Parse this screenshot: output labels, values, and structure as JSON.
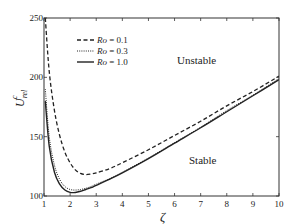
{
  "chart_data": {
    "type": "line",
    "title": "",
    "xlabel": "ζ",
    "ylabel": "U_rel^c",
    "xlim": [
      1,
      10
    ],
    "ylim": [
      100,
      250
    ],
    "xticks": [
      "1",
      "2",
      "3",
      "4",
      "5",
      "6",
      "7",
      "8",
      "9",
      "10"
    ],
    "yticks": [
      "100",
      "150",
      "200",
      "250"
    ],
    "grid": false,
    "legend_position": "upper left",
    "annotations": [
      "Unstable",
      "Stable"
    ],
    "x": [
      1.05,
      1.2,
      1.4,
      1.6,
      1.8,
      2.0,
      2.2,
      2.4,
      2.6,
      2.8,
      3.0,
      3.5,
      4.0,
      5.0,
      6.0,
      7.0,
      8.0,
      9.0,
      10.0
    ],
    "series": [
      {
        "name": "Ro = 0.1",
        "style": "dashed",
        "values": [
          250,
          205,
          172,
          151,
          137,
          128,
          122,
          119,
          118,
          118.5,
          119.5,
          123,
          128,
          139,
          151,
          163,
          176,
          188,
          201
        ]
      },
      {
        "name": "Ro = 0.3",
        "style": "dotted",
        "values": [
          190,
          150,
          126,
          114,
          108,
          105.5,
          105,
          105.5,
          106.5,
          108,
          110,
          114.5,
          120,
          132,
          145,
          158,
          172,
          185,
          199
        ]
      },
      {
        "name": "Ro = 1.0",
        "style": "solid",
        "values": [
          180,
          142,
          120,
          110,
          105,
          103,
          103,
          104,
          105.5,
          107,
          109,
          114,
          119.5,
          131.5,
          144.5,
          157.5,
          171,
          184.5,
          198
        ]
      }
    ]
  },
  "labels": {
    "ylabel_main": "U",
    "ylabel_sup": "c",
    "ylabel_sub": "rel",
    "xlabel": "ζ",
    "unstable": "Unstable",
    "stable": "Stable",
    "legend": [
      "Ro = 0.1",
      "Ro = 0.3",
      "Ro = 1.0"
    ]
  }
}
